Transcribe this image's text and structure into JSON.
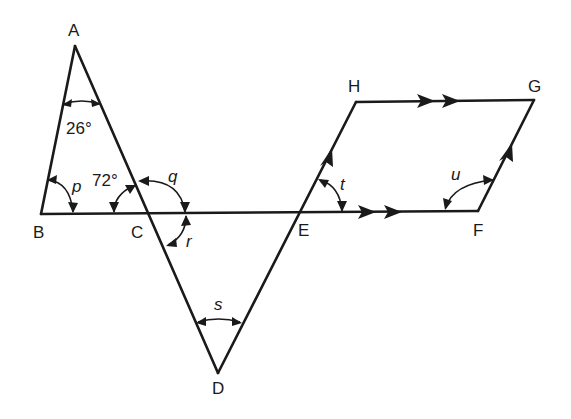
{
  "figure": {
    "type": "geometry-diagram",
    "line_color": "#1a1a1a",
    "background": "#ffffff"
  },
  "points": {
    "A": {
      "label": "A"
    },
    "B": {
      "label": "B"
    },
    "C": {
      "label": "C"
    },
    "D": {
      "label": "D"
    },
    "E": {
      "label": "E"
    },
    "F": {
      "label": "F"
    },
    "G": {
      "label": "G"
    },
    "H": {
      "label": "H"
    }
  },
  "segments": [
    {
      "name": "AB",
      "from": "A",
      "to": "B"
    },
    {
      "name": "AD",
      "from": "A",
      "to": "D"
    },
    {
      "name": "BF",
      "from": "B",
      "to": "F"
    },
    {
      "name": "DH",
      "from": "D",
      "to": "H"
    },
    {
      "name": "HG",
      "from": "H",
      "to": "G"
    },
    {
      "name": "FG",
      "from": "F",
      "to": "G"
    }
  ],
  "parallel_marks": {
    "double": [
      "EF",
      "HG"
    ],
    "single": [
      "EH",
      "FG"
    ]
  },
  "angles": [
    {
      "id": "angle_A",
      "vertex": "A",
      "label": "26°",
      "known": true
    },
    {
      "id": "angle_ACB",
      "vertex": "C",
      "label": "72°",
      "known": true
    },
    {
      "id": "angle_p",
      "vertex": "B",
      "label": "p",
      "known": false
    },
    {
      "id": "angle_q",
      "vertex": "C",
      "label": "q",
      "known": false
    },
    {
      "id": "angle_r",
      "vertex": "C",
      "label": "r",
      "known": false
    },
    {
      "id": "angle_s",
      "vertex": "D",
      "label": "s",
      "known": false
    },
    {
      "id": "angle_t",
      "vertex": "E",
      "label": "t",
      "known": false
    },
    {
      "id": "angle_u",
      "vertex": "F",
      "label": "u",
      "known": false
    }
  ]
}
